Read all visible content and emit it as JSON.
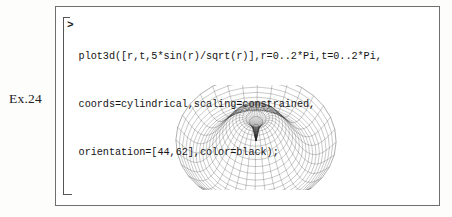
{
  "page": {
    "exercise_label": "Ex.24",
    "background_color": "#fdfdfc",
    "frame_color": "#6f6f6f"
  },
  "worksheet": {
    "prompt": ">",
    "bracket": "execution-group-bracket",
    "code_lines": [
      "plot3d([r,t,5*sin(r)/sqrt(r)],r=0..2*Pi,t=0..2*Pi,",
      "coords=cylindrical,scaling=constrained,",
      "orientation=[44,62],color=black);"
    ]
  },
  "chart_data": {
    "type": "surface",
    "title": "",
    "subtitle": "",
    "xlabel": "",
    "ylabel": "",
    "zlabel": "",
    "legend": [],
    "grid": true,
    "render": "wireframe-mesh",
    "color": "#000000",
    "coords": "cylindrical",
    "scaling": "constrained",
    "orientation": [
      44,
      62
    ],
    "expression": "[r, t, 5*sin(r)/sqrt(r)]",
    "parameters": {
      "r": {
        "min": 0,
        "max": 6.283185307,
        "label": "0..2*Pi"
      },
      "t": {
        "min": 0,
        "max": 6.283185307,
        "label": "0..2*Pi"
      }
    },
    "mesh": {
      "radial_divisions": 24,
      "angular_divisions": 32
    },
    "z_profile": {
      "description": "z = 5*sin(r)/sqrt(r), sombrero/volcano surface",
      "r_samples": [
        0.0,
        0.26,
        0.52,
        0.79,
        1.05,
        1.31,
        1.57,
        1.83,
        2.09,
        2.36,
        2.62,
        2.88,
        3.14,
        3.4,
        3.67,
        3.93,
        4.19,
        4.45,
        4.71,
        4.97,
        5.24,
        5.5,
        5.76,
        6.02,
        6.28
      ],
      "z_values": [
        0.0,
        2.52,
        4.97,
        3.96,
        4.23,
        4.23,
        3.99,
        3.59,
        3.02,
        2.33,
        1.55,
        0.73,
        -0.09,
        -0.89,
        -1.64,
        -2.31,
        -2.87,
        -3.29,
        -3.56,
        -3.67,
        -3.61,
        -3.38,
        -3.0,
        -2.48,
        -1.84
      ],
      "zlim": [
        -3.7,
        5.0
      ]
    }
  }
}
